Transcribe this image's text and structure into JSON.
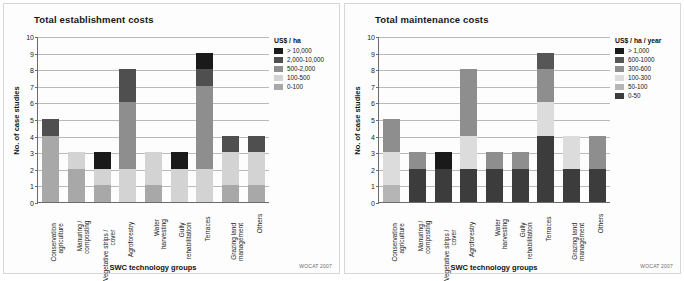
{
  "credit": "WOCAT 2007",
  "charts": [
    {
      "title": "Total establishment costs",
      "ylabel": "No. of case studies",
      "xlabel": "SWC technology groups",
      "legend_title": "US$ / ha",
      "legend": [
        {
          "label": "> 10,000",
          "color": "#1a1a1a"
        },
        {
          "label": "2,000-10,000",
          "color": "#4f4f4f"
        },
        {
          "label": "500-2,000",
          "color": "#8e8e8e"
        },
        {
          "label": "100-500",
          "color": "#d3d3d3"
        },
        {
          "label": "0-100",
          "color": "#a8a8a8"
        }
      ],
      "chart_data": {
        "type": "bar",
        "title": "Total establishment costs",
        "xlabel": "SWC technology groups",
        "ylabel": "No. of case studies",
        "ylim": [
          0,
          10
        ],
        "yticks": [
          0,
          1,
          2,
          3,
          4,
          5,
          6,
          7,
          8,
          9,
          10
        ],
        "grid": true,
        "legend_position": "right",
        "stacked": true,
        "categories": [
          "Conservation agriculture",
          "Manuring / composting",
          "Vegetative strips / cover",
          "Agroforestry",
          "Water harvesting",
          "Gully rehabilitation",
          "Terraces",
          "Grazing land management",
          "Others"
        ],
        "series": [
          {
            "name": "0-100",
            "color": "#a8a8a8",
            "values": [
              4,
              2,
              1,
              0,
              1,
              0,
              0,
              1,
              1
            ]
          },
          {
            "name": "100-500",
            "color": "#d3d3d3",
            "values": [
              0,
              1,
              1,
              2,
              2,
              2,
              2,
              2,
              2
            ]
          },
          {
            "name": "500-2,000",
            "color": "#8e8e8e",
            "values": [
              0,
              0,
              0,
              4,
              0,
              0,
              5,
              0,
              0
            ]
          },
          {
            "name": "2,000-10,000",
            "color": "#4f4f4f",
            "values": [
              1,
              0,
              0,
              2,
              0,
              0,
              1,
              1,
              1
            ]
          },
          {
            "name": "> 10,000",
            "color": "#1a1a1a",
            "values": [
              0,
              0,
              1,
              0,
              0,
              1,
              1,
              0,
              0
            ]
          }
        ],
        "totals": [
          5,
          3,
          3,
          8,
          3,
          3,
          9,
          4,
          4
        ]
      }
    },
    {
      "title": "Total maintenance costs",
      "ylabel": "No. of case studies",
      "xlabel": "SWC technology groups",
      "legend_title": "US$ / ha / year",
      "legend": [
        {
          "label": "> 1,000",
          "color": "#1a1a1a"
        },
        {
          "label": "600-1000",
          "color": "#565656"
        },
        {
          "label": "300-600",
          "color": "#8e8e8e"
        },
        {
          "label": "100-300",
          "color": "#dcdcdc"
        },
        {
          "label": "50-100",
          "color": "#b5b5b5"
        },
        {
          "label": "0-50",
          "color": "#3c3c3c"
        }
      ],
      "chart_data": {
        "type": "bar",
        "title": "Total maintenance costs",
        "xlabel": "SWC technology groups",
        "ylabel": "No. of case studies",
        "ylim": [
          0,
          10
        ],
        "yticks": [
          0,
          1,
          2,
          3,
          4,
          5,
          6,
          7,
          8,
          9,
          10
        ],
        "grid": true,
        "legend_position": "right",
        "stacked": true,
        "categories": [
          "Conservation agriculture",
          "Manuring / composting",
          "Vegetative strips / cover",
          "Agroforestry",
          "Water harvesting",
          "Gully rehabilitation",
          "Terraces",
          "Grazing land management",
          "Others"
        ],
        "series": [
          {
            "name": "0-50",
            "color": "#3c3c3c",
            "values": [
              0,
              2,
              2,
              2,
              2,
              2,
              4,
              2,
              2
            ]
          },
          {
            "name": "50-100",
            "color": "#b5b5b5",
            "values": [
              1,
              0,
              0,
              0,
              0,
              0,
              0,
              0,
              0
            ]
          },
          {
            "name": "100-300",
            "color": "#dcdcdc",
            "values": [
              2,
              0,
              0,
              2,
              0,
              0,
              2,
              2,
              0
            ]
          },
          {
            "name": "300-600",
            "color": "#8e8e8e",
            "values": [
              2,
              1,
              0,
              4,
              1,
              1,
              2,
              0,
              2
            ]
          },
          {
            "name": "600-1000",
            "color": "#565656",
            "values": [
              0,
              0,
              0,
              0,
              0,
              0,
              1,
              0,
              0
            ]
          },
          {
            "name": "> 1,000",
            "color": "#1a1a1a",
            "values": [
              0,
              0,
              1,
              0,
              0,
              0,
              0,
              0,
              0
            ]
          }
        ],
        "totals": [
          5,
          3,
          3,
          8,
          3,
          3,
          9,
          4,
          4
        ]
      }
    }
  ]
}
